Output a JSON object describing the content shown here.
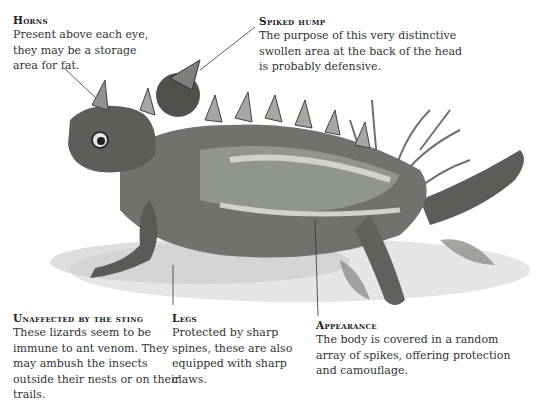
{
  "labels": {
    "horns": {
      "title": "Horns",
      "text": "Present above each eye, they may be a storage area for fat."
    },
    "spiked_hump": {
      "title": "Spiked hump",
      "text": "The purpose of this very distinctive swollen area at the back of the head is probably defensive."
    },
    "unaffected": {
      "title": "Unaffected by the sting",
      "text": "These lizards seem to be immune to ant venom. They may ambush the insects outside their nests or on their trails."
    },
    "legs": {
      "title": "Legs",
      "text": "Protected by sharp spines, these are also equipped with sharp claws."
    },
    "appearance": {
      "title": "Appearance",
      "text": "The body is covered in a random array of spikes, offering protection and camouflage."
    }
  },
  "illustration": {
    "subject": "thorny devil lizard",
    "colors": {
      "dark": "#3a3d3a",
      "mid": "#7d807c",
      "light": "#c9cbc6"
    }
  }
}
